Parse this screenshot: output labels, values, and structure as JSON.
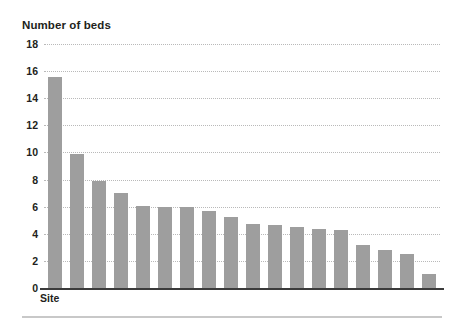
{
  "chart_data": {
    "type": "bar",
    "title": "Number of beds",
    "subtitle": "",
    "xlabel": "Site",
    "ylabel": "Number of beds",
    "ylim": [
      0,
      18
    ],
    "yticks": [
      0,
      2,
      4,
      6,
      8,
      10,
      12,
      14,
      16,
      18
    ],
    "ytick_labels": [
      "0",
      "2",
      "4",
      "6",
      "8",
      "10",
      "12",
      "14",
      "16",
      "18"
    ],
    "grid": "horizontal-dotted",
    "legend": "none",
    "bar_color": "#9e9e9e",
    "categories": [
      "1",
      "2",
      "3",
      "4",
      "5",
      "6",
      "7",
      "8",
      "9",
      "10",
      "11",
      "12",
      "13",
      "14",
      "15",
      "16",
      "17",
      "18"
    ],
    "values": [
      15.6,
      9.9,
      7.9,
      7.0,
      6.05,
      6.0,
      5.95,
      5.7,
      5.25,
      4.7,
      4.65,
      4.5,
      4.35,
      4.3,
      3.2,
      2.8,
      2.5,
      1.0
    ],
    "xtick_labels": [],
    "annotations": []
  },
  "axes": {
    "baseline_color": "#3b3b3b",
    "gridline_color": "#b9b9b9",
    "text_color": "#231f20"
  },
  "footer": {
    "rule_color": "#c8c8c8"
  }
}
